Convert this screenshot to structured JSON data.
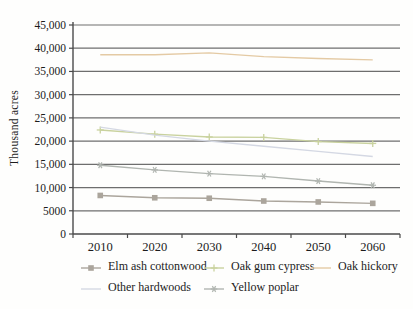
{
  "chart_data": {
    "type": "line",
    "title": "",
    "xlabel": "",
    "ylabel": "Thousand acres",
    "ylim": [
      0,
      45000
    ],
    "ytick_interval": 5000,
    "ytick_labels": [
      "0",
      "5000",
      "10,000",
      "15,000",
      "20,000",
      "25,000",
      "30,000",
      "35,000",
      "40,000",
      "45,000"
    ],
    "categories": [
      "2010",
      "2020",
      "2030",
      "2040",
      "2050",
      "2060"
    ],
    "grid": true,
    "legend_position": "bottom",
    "series": [
      {
        "name": "Elm ash cottonwood",
        "marker": "square",
        "color": "#aba59c",
        "values": [
          8300,
          7800,
          7700,
          7100,
          6900,
          6600
        ]
      },
      {
        "name": "Oak gum cypress",
        "marker": "plus",
        "color": "#c9d29e",
        "values": [
          22400,
          21500,
          20900,
          20800,
          19900,
          19500
        ]
      },
      {
        "name": "Oak hickory",
        "marker": "none",
        "color": "#e4caa4",
        "values": [
          38600,
          38600,
          39000,
          38200,
          37800,
          37500
        ]
      },
      {
        "name": "Other hardwoods",
        "marker": "none",
        "color": "#d4d8e3",
        "values": [
          23000,
          21300,
          20000,
          18900,
          17800,
          16700
        ]
      },
      {
        "name": "Yellow poplar",
        "marker": "asterisk",
        "color": "#b0b5b0",
        "values": [
          14800,
          13800,
          13000,
          12400,
          11400,
          10500
        ]
      }
    ],
    "axis_color": "#4a4a4a",
    "grid_color": "#6e6e6e"
  }
}
